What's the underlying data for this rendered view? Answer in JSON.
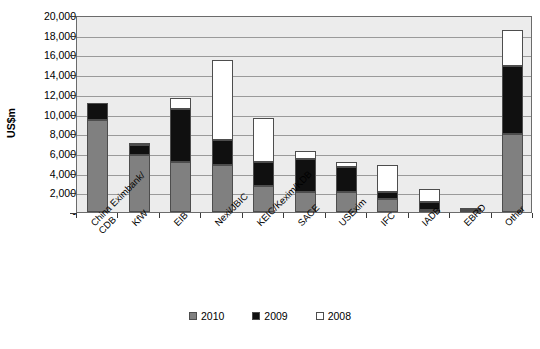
{
  "chart_data": {
    "type": "bar",
    "subtype": "stacked-vertical",
    "title": "",
    "xlabel": "",
    "ylabel": "US$m",
    "ylim": [
      0,
      20000
    ],
    "ytick_values": [
      0,
      2000,
      4000,
      6000,
      8000,
      10000,
      12000,
      14000,
      16000,
      18000,
      20000
    ],
    "ytick_labels": [
      "-",
      "2,000",
      "4,000",
      "6,000",
      "8,000",
      "10,000",
      "12,000",
      "14,000",
      "16,000",
      "18,000",
      "20,000"
    ],
    "grid": true,
    "legend_position": "bottom",
    "categories": [
      "China Eximbank/\nCDB",
      "KfW",
      "EIB",
      "Nexi/JBIC",
      "KEIC/Kexim/KDB",
      "SACE",
      "USExim",
      "IFC",
      "IADB",
      "EBRD",
      "Other"
    ],
    "series": [
      {
        "name": "2010",
        "color": "#808080",
        "values": [
          9350,
          5750,
          5100,
          4800,
          2600,
          2000,
          2000,
          1300,
          200,
          0,
          7900
        ]
      },
      {
        "name": "2009",
        "color": "#101010",
        "values": [
          1700,
          1050,
          5400,
          2500,
          2500,
          3400,
          2600,
          700,
          800,
          200,
          6900
        ]
      },
      {
        "name": "2008",
        "color": "#ffffff",
        "values": [
          0,
          150,
          1100,
          8100,
          4400,
          800,
          500,
          2800,
          1300,
          150,
          3700
        ]
      }
    ],
    "totals": [
      11050,
      6950,
      11600,
      15400,
      9500,
      6200,
      5100,
      4800,
      2300,
      350,
      18500
    ]
  },
  "legend": {
    "items": [
      {
        "label": "2010",
        "swatch": "swatch-2010"
      },
      {
        "label": "2009",
        "swatch": "swatch-2009"
      },
      {
        "label": "2008",
        "swatch": "swatch-2008"
      }
    ]
  }
}
